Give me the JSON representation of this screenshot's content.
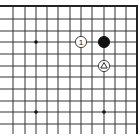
{
  "diagram": {
    "type": "go-board-fragment",
    "corner": "top-right",
    "colors": {
      "background": "#ffffff",
      "line": "#333333",
      "edge": "#222222",
      "black_stone": "#111111",
      "white_stone": "#ffffff",
      "stone_outline": "#333333"
    },
    "grid": {
      "columns_x": [
        13,
        25,
        36,
        47,
        58,
        70,
        81,
        92,
        104,
        115,
        126,
        137
      ],
      "rows_y": [
        6,
        19,
        31,
        42,
        54,
        66,
        77,
        89,
        101,
        112,
        124
      ],
      "left_extend_to": 0,
      "bottom_extend_to": 134,
      "top_edge": true,
      "right_edge": true
    },
    "star_points": [
      {
        "col": 2,
        "row": 3
      },
      {
        "col": 2,
        "row": 9
      },
      {
        "col": 8,
        "row": 9
      }
    ],
    "stones": [
      {
        "name": "white-stone-move-1",
        "color": "white",
        "col": 6,
        "row": 3,
        "label": "1",
        "marker": "none"
      },
      {
        "name": "black-stone",
        "color": "black",
        "col": 8,
        "row": 3,
        "label": "",
        "marker": "none"
      },
      {
        "name": "white-stone-triangle",
        "color": "white",
        "col": 8,
        "row": 5,
        "label": "",
        "marker": "triangle"
      }
    ]
  }
}
